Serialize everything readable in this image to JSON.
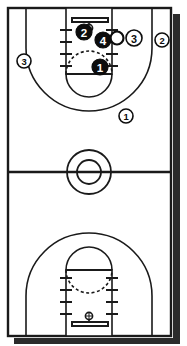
{
  "diagram": {
    "court_type": "full-court",
    "line_color": "#1a1a1a",
    "court_fill": "#ffffff",
    "shadow_color": "#2b2b2b",
    "offense_marker_fill": "#0d0d0d",
    "offense_marker_text": "#ffffff",
    "defense_marker_fill": "#ffffff",
    "defense_marker_text": "#0d0d0d",
    "ball_fill": "#ffffff",
    "ball_stroke": "#0d0d0d"
  },
  "court": {
    "outline": {
      "x": 8,
      "y": 8,
      "width": 163,
      "height": 328
    },
    "halfcourt_line_y": 172,
    "center_circle": {
      "cx": 89,
      "cy": 172,
      "r_outer": 22,
      "r_inner": 12
    },
    "top_basket": {
      "backboard_label": "backboard",
      "hoop_label": "hoop",
      "backboard_y": 20,
      "hoop_cy": 28
    },
    "bottom_basket": {
      "backboard_label": "backboard",
      "hoop_label": "hoop",
      "backboard_y": 324,
      "hoop_cy": 316
    },
    "lane_hash_count": 4
  },
  "players": [
    {
      "id": "p-2-paint",
      "number": "2",
      "team": "offense",
      "style": "filled",
      "cx": 84,
      "cy": 32,
      "r": 8,
      "description": "offense player 2 in the paint near the rim"
    },
    {
      "id": "p-4-paint",
      "number": "4",
      "team": "offense",
      "style": "filled",
      "cx": 103,
      "cy": 40,
      "r": 8,
      "description": "offense player 4 beside the ball"
    },
    {
      "id": "p-3-wing",
      "number": "3",
      "team": "defense",
      "style": "outlined",
      "cx": 134,
      "cy": 38,
      "r": 8,
      "description": "player 3 on right side of the lane"
    },
    {
      "id": "p-2-corner",
      "number": "2",
      "team": "defense",
      "style": "outlined",
      "cx": 162,
      "cy": 40,
      "r": 7,
      "description": "player 2 on right wing outside three-point line"
    },
    {
      "id": "p-3-left",
      "number": "3",
      "team": "defense",
      "style": "outlined",
      "cx": 24,
      "cy": 61,
      "r": 7,
      "description": "player 3 on left wing outside three-point line"
    },
    {
      "id": "p-1-ft",
      "number": "1",
      "team": "offense",
      "style": "filled",
      "cx": 100,
      "cy": 67,
      "r": 8,
      "description": "offense player 1 at the free throw line"
    },
    {
      "id": "p-1-top",
      "number": "1",
      "team": "defense",
      "style": "outlined",
      "cx": 126,
      "cy": 116,
      "r": 7,
      "description": "player 1 above the three-point arc"
    }
  ],
  "ball": {
    "id": "ball",
    "label": "ball",
    "cx": 117,
    "cy": 38,
    "r": 6.5
  }
}
